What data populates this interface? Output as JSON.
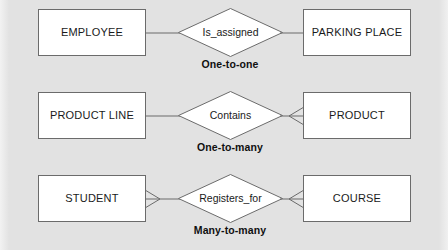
{
  "diagram": {
    "type": "entity-relationship-cardinality",
    "background_color": "#e2e2e2",
    "entity_fill": "#ffffff",
    "stroke_color": "#6b6b6b",
    "text_color": "#1a1a1a",
    "rows": [
      {
        "left_entity": "EMPLOYEE",
        "relationship": "Is_assigned",
        "right_entity": "PARKING PLACE",
        "cardinality": "One-to-one",
        "left_connector": "plain-line",
        "right_connector": "plain-line"
      },
      {
        "left_entity": "PRODUCT LINE",
        "relationship": "Contains",
        "right_entity": "PRODUCT",
        "cardinality": "One-to-many",
        "left_connector": "plain-line",
        "right_connector": "crows-foot"
      },
      {
        "left_entity": "STUDENT",
        "relationship": "Registers_for",
        "right_entity": "COURSE",
        "cardinality": "Many-to-many",
        "left_connector": "crows-foot",
        "right_connector": "crows-foot"
      }
    ]
  }
}
